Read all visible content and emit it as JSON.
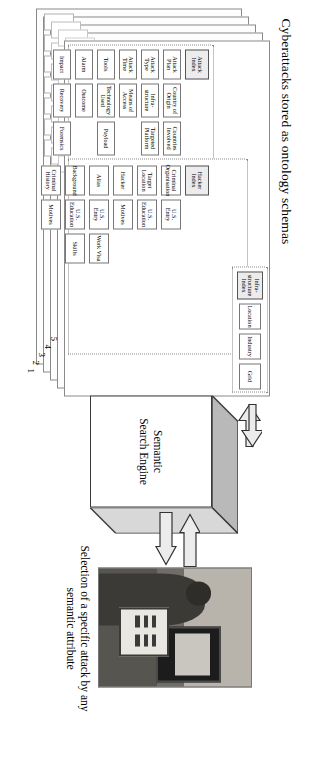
{
  "figure": {
    "title": "Cyberattacks stored as ontology schemas",
    "caption": "Selection of a specific attack by any semantic attribute"
  },
  "stack": {
    "layer_numbers": [
      "1",
      "2",
      "3",
      "4",
      "5"
    ]
  },
  "attack_schema": {
    "index_label": "Attack Index",
    "rows": [
      [
        "Attack Plan",
        "Country of Origin",
        "Countries Involved"
      ],
      [
        "Attack Type",
        "Infra-structure",
        "Targeted Platform"
      ],
      [
        "Attack Time",
        "Means of Access",
        ""
      ],
      [
        "Tools",
        "Technology Used",
        "Payload"
      ],
      [
        "Alarm",
        "Outcome",
        ""
      ],
      [
        "Impact",
        "Recovery",
        "Forensics"
      ]
    ]
  },
  "hacker_schema": {
    "index_label": "Hacker Index",
    "rows": [
      [
        "Criminal Organisation",
        "U.S. Entry",
        ""
      ],
      [
        "Target Location",
        "U.S. Education",
        ""
      ],
      [
        "Hacker",
        "Motives",
        ""
      ],
      [
        "Alias",
        "U.S. Entry",
        "Work Visa"
      ],
      [
        "Background",
        "U.S. Education",
        "Skills"
      ],
      [
        "Criminal History",
        "Motives",
        ""
      ]
    ]
  },
  "infrastructure_schema": {
    "index_label": "Infra-structure Index",
    "rows": [
      [
        "Location"
      ],
      [
        "Industry"
      ],
      [
        "Grid"
      ]
    ]
  },
  "engine": {
    "label": "Semantic\nSearch Engine",
    "line1": "Semantic",
    "line2": "Search Engine"
  },
  "arrows": {
    "left_out": "arrow-up-from-engine",
    "left_in": "arrow-down-into-engine",
    "right_out": "arrow-from-user-to-engine",
    "right_in": "arrow-from-engine-to-user"
  },
  "photo": {
    "alt": "person seated at a desk using a computer terminal and tablet"
  },
  "colors": {
    "index_fill": "#ececec",
    "border": "#8a8a8a",
    "arrow_fill": "#e8e8e8",
    "cube_top": "#b9b9b9",
    "cube_side": "#d8d8d8"
  }
}
